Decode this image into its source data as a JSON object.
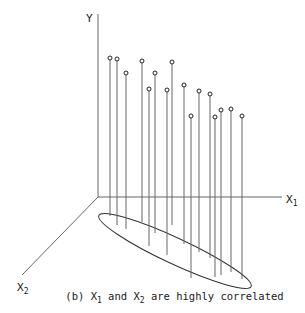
{
  "figure": {
    "caption_prefix": "(b) X",
    "caption_sub1": "1",
    "caption_mid": " and X",
    "caption_sub2": "2",
    "caption_suffix": " are highly correlated"
  },
  "axes": {
    "y_label": "Y",
    "x1_label": "X",
    "x1_sub": "1",
    "x2_label": "X",
    "x2_sub": "2"
  },
  "chart_data": {
    "type": "scatter",
    "title": "(b) X1 and X2 are highly correlated",
    "axes": [
      "X1",
      "X2",
      "Y"
    ],
    "points_screen": [
      {
        "x": 110,
        "top": 58,
        "base": 216
      },
      {
        "x": 117,
        "top": 59,
        "base": 225
      },
      {
        "x": 126,
        "top": 73,
        "base": 229
      },
      {
        "x": 142,
        "top": 61,
        "base": 222
      },
      {
        "x": 149,
        "top": 89,
        "base": 246
      },
      {
        "x": 155,
        "top": 73,
        "base": 233
      },
      {
        "x": 167,
        "top": 90,
        "base": 255
      },
      {
        "x": 172,
        "top": 62,
        "base": 225
      },
      {
        "x": 184,
        "top": 85,
        "base": 244
      },
      {
        "x": 191,
        "top": 116,
        "base": 278
      },
      {
        "x": 199,
        "top": 91,
        "base": 252
      },
      {
        "x": 210,
        "top": 94,
        "base": 258
      },
      {
        "x": 215,
        "top": 117,
        "base": 277
      },
      {
        "x": 221,
        "top": 110,
        "base": 275
      },
      {
        "x": 231,
        "top": 109,
        "base": 272
      },
      {
        "x": 242,
        "top": 116,
        "base": 279
      }
    ],
    "ellipse": {
      "cx": 175,
      "cy": 251,
      "rx": 84,
      "ry": 13,
      "rotate_deg": 25
    }
  }
}
